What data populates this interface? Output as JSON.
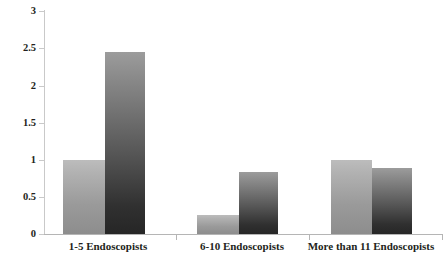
{
  "chart_data": {
    "type": "bar",
    "title": "",
    "subtitle": "",
    "xlabel": "",
    "ylabel": "",
    "categories": [
      "1-5 Endoscopists",
      "6-10 Endoscopists",
      "More than 11 Endoscopists"
    ],
    "series": [
      {
        "name": "Series 1",
        "color": "#b1b1b1",
        "values": [
          1.0,
          0.25,
          1.0
        ]
      },
      {
        "name": "Series 2",
        "color": "#575757",
        "values": [
          2.45,
          0.83,
          0.89
        ]
      }
    ],
    "ylim": [
      0,
      3
    ],
    "yticks": [
      0,
      0.5,
      1,
      1.5,
      2,
      2.5,
      3
    ],
    "ytick_labels": [
      "0",
      "0.5",
      "1",
      "1.5",
      "2",
      "2.5",
      "3"
    ],
    "grid": false,
    "legend": "none",
    "annotations": []
  },
  "axis": {
    "y_tick_labels": [
      "3",
      "2.5",
      "2",
      "1.5",
      "1",
      "0.5",
      "0"
    ],
    "x_tick_labels": [
      "1-5 Endoscopists",
      "6-10 Endoscopists",
      "More than 11 Endoscopists"
    ]
  },
  "colors": {
    "light_bar_top": "#bcbcbc",
    "light_bar_bottom": "#8d8d8d",
    "dark_bar_top": "#9c9c9c",
    "dark_bar_bottom": "#262626",
    "axis_line": "#c9c9c9",
    "text": "#231f20",
    "background": "#ffffff"
  }
}
